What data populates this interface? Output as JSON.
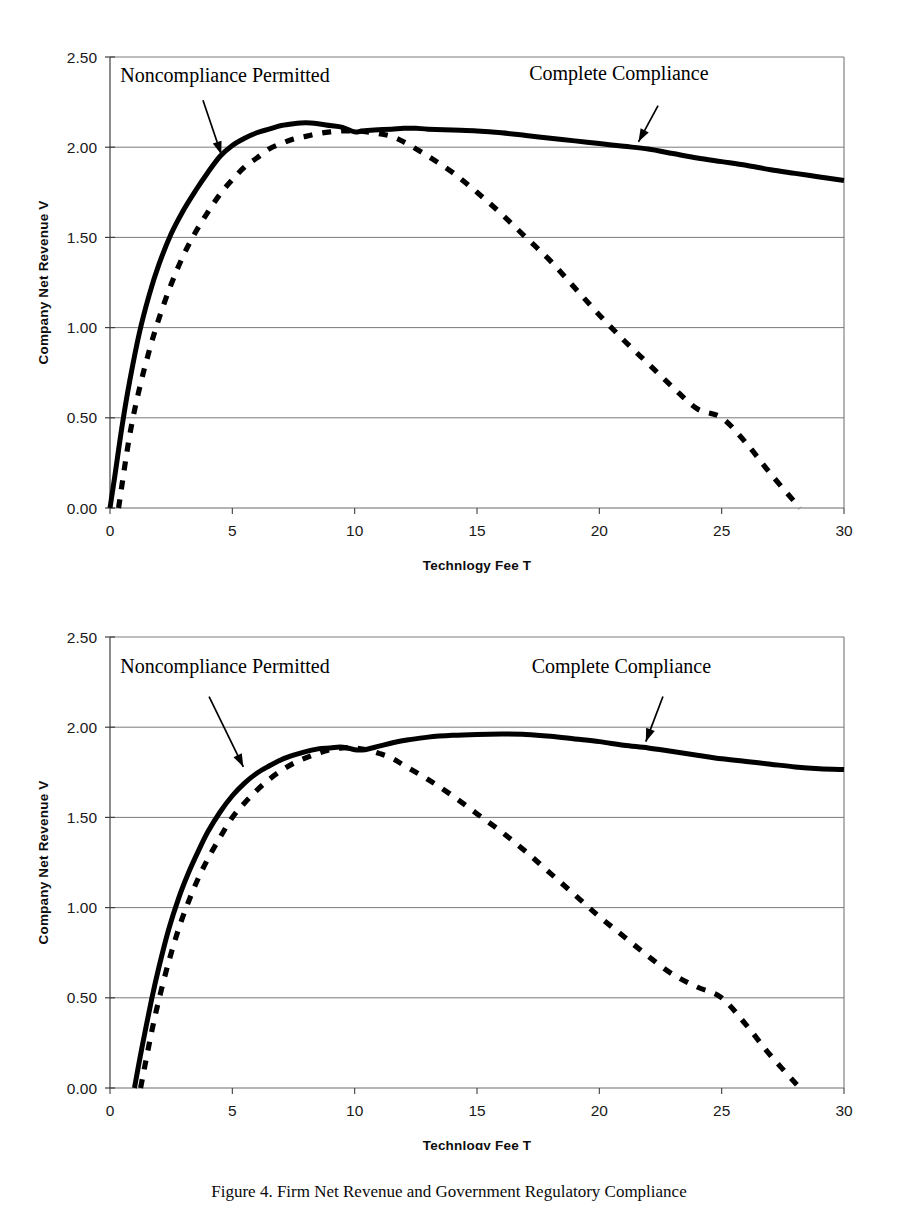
{
  "document": {
    "caption_text": "Figure 4. Firm Net Revenue and Government Regulatory Compliance"
  },
  "chart_data": [
    {
      "id": "figure-1",
      "type": "line",
      "title": "",
      "xlabel": "Technlogy Fee T",
      "ylabel": "Company Net Revenue V",
      "xlim": [
        0,
        30
      ],
      "ylim": [
        0.0,
        2.5
      ],
      "xticks": [
        "0",
        "5",
        "10",
        "15",
        "20",
        "25",
        "30"
      ],
      "xtick_values": [
        0,
        5,
        10,
        15,
        20,
        25,
        30
      ],
      "yticks": [
        "0.00",
        "0.50",
        "1.00",
        "1.50",
        "2.00",
        "2.50"
      ],
      "ytick_values": [
        0.0,
        0.5,
        1.0,
        1.5,
        2.0,
        2.5
      ],
      "grid": "horizontal",
      "legend_position": "annotations",
      "annotations": [
        {
          "name": "noncompliance-permitted",
          "label": "Noncompliance Permitted",
          "label_x": 4.7,
          "label_y": 2.36,
          "arrow_from": [
            3.8,
            2.26
          ],
          "arrow_to": [
            4.55,
            1.96
          ]
        },
        {
          "name": "complete-compliance",
          "label": "Complete Compliance",
          "label_x": 20.8,
          "label_y": 2.37,
          "arrow_from": [
            22.4,
            2.23
          ],
          "arrow_to": [
            21.6,
            2.03
          ]
        }
      ],
      "series": [
        {
          "name": "Complete Compliance",
          "style": "solid",
          "color": "#000000",
          "x": [
            0.0,
            0.2,
            0.5,
            0.8,
            1.2,
            1.6,
            2.0,
            2.5,
            3.0,
            3.5,
            4.0,
            4.5,
            5.0,
            5.5,
            6.0,
            6.5,
            7.0,
            7.5,
            8.0,
            8.5,
            9.0,
            9.5,
            10.0,
            10.3,
            10.8,
            11.5,
            12.0,
            12.5,
            13.0,
            14.0,
            15.0,
            16.0,
            17.0,
            18.0,
            19.0,
            20.0,
            21.0,
            22.0,
            23.0,
            24.0,
            25.0,
            26.0,
            27.0,
            28.0,
            29.0,
            30.0
          ],
          "y": [
            0.0,
            0.18,
            0.46,
            0.7,
            0.97,
            1.18,
            1.35,
            1.52,
            1.65,
            1.76,
            1.86,
            1.95,
            2.01,
            2.05,
            2.08,
            2.1,
            2.12,
            2.13,
            2.135,
            2.13,
            2.12,
            2.11,
            2.085,
            2.09,
            2.095,
            2.1,
            2.105,
            2.105,
            2.1,
            2.095,
            2.09,
            2.08,
            2.065,
            2.05,
            2.035,
            2.02,
            2.005,
            1.99,
            1.965,
            1.94,
            1.92,
            1.9,
            1.875,
            1.855,
            1.835,
            1.815
          ]
        },
        {
          "name": "Noncompliance Permitted",
          "style": "dashed",
          "color": "#000000",
          "x": [
            0.35,
            0.8,
            1.2,
            1.6,
            2.0,
            2.5,
            3.0,
            3.5,
            4.0,
            4.5,
            5.0,
            5.5,
            6.0,
            6.5,
            7.0,
            7.5,
            8.0,
            8.5,
            9.0,
            9.5,
            10.0,
            10.5,
            11.0,
            11.5,
            12.0,
            13.0,
            14.0,
            15.0,
            16.0,
            17.0,
            18.0,
            19.0,
            20.0,
            21.0,
            22.0,
            23.0,
            24.0,
            25.0,
            26.0,
            27.0,
            28.2
          ],
          "y": [
            0.0,
            0.4,
            0.66,
            0.87,
            1.05,
            1.24,
            1.4,
            1.53,
            1.64,
            1.74,
            1.82,
            1.89,
            1.94,
            1.99,
            2.02,
            2.045,
            2.06,
            2.075,
            2.085,
            2.09,
            2.09,
            2.085,
            2.075,
            2.06,
            2.03,
            1.95,
            1.86,
            1.75,
            1.63,
            1.5,
            1.37,
            1.22,
            1.07,
            0.93,
            0.8,
            0.67,
            0.55,
            0.5,
            0.36,
            0.19,
            0.0
          ]
        }
      ]
    },
    {
      "id": "figure-2",
      "type": "line",
      "title": "",
      "xlabel": "Technlogy Fee T",
      "ylabel": "Company Net Revenue V",
      "xlim": [
        0,
        30
      ],
      "ylim": [
        0.0,
        2.5
      ],
      "xticks": [
        "0",
        "5",
        "10",
        "15",
        "20",
        "25",
        "30"
      ],
      "xtick_values": [
        0,
        5,
        10,
        15,
        20,
        25,
        30
      ],
      "yticks": [
        "0.00",
        "0.50",
        "1.00",
        "1.50",
        "2.00",
        "2.50"
      ],
      "ytick_values": [
        0.0,
        0.5,
        1.0,
        1.5,
        2.0,
        2.5
      ],
      "grid": "horizontal",
      "legend_position": "annotations",
      "annotations": [
        {
          "name": "noncompliance-permitted",
          "label": "Noncompliance Permitted",
          "label_x": 4.7,
          "label_y": 2.3,
          "arrow_from": [
            4.05,
            2.17
          ],
          "arrow_to": [
            5.45,
            1.78
          ]
        },
        {
          "name": "complete-compliance",
          "label": "Complete Compliance",
          "label_x": 20.9,
          "label_y": 2.3,
          "arrow_from": [
            22.6,
            2.17
          ],
          "arrow_to": [
            21.9,
            1.92
          ]
        }
      ],
      "series": [
        {
          "name": "Complete Compliance",
          "style": "solid",
          "color": "#000000",
          "x": [
            1.0,
            1.3,
            1.7,
            2.0,
            2.4,
            2.8,
            3.2,
            3.6,
            4.0,
            4.5,
            5.0,
            5.5,
            6.0,
            6.5,
            7.0,
            7.5,
            8.0,
            8.5,
            9.0,
            9.4,
            9.7,
            10.0,
            10.4,
            11.0,
            11.6,
            12.2,
            13.0,
            14.0,
            15.0,
            16.0,
            17.0,
            18.0,
            19.0,
            20.0,
            21.0,
            22.0,
            23.0,
            24.0,
            25.0,
            26.0,
            27.0,
            28.0,
            29.0,
            30.0
          ],
          "y": [
            0.0,
            0.22,
            0.49,
            0.67,
            0.88,
            1.05,
            1.19,
            1.31,
            1.42,
            1.53,
            1.62,
            1.69,
            1.745,
            1.785,
            1.82,
            1.845,
            1.865,
            1.88,
            1.885,
            1.89,
            1.885,
            1.875,
            1.875,
            1.895,
            1.915,
            1.93,
            1.945,
            1.955,
            1.96,
            1.962,
            1.96,
            1.95,
            1.935,
            1.92,
            1.9,
            1.885,
            1.865,
            1.845,
            1.825,
            1.81,
            1.795,
            1.78,
            1.77,
            1.765
          ]
        },
        {
          "name": "Noncompliance Permitted",
          "style": "dashed",
          "color": "#000000",
          "x": [
            1.25,
            1.7,
            2.0,
            2.4,
            2.8,
            3.2,
            3.6,
            4.0,
            4.5,
            5.0,
            5.5,
            6.0,
            6.5,
            7.0,
            7.5,
            8.0,
            8.5,
            9.0,
            9.5,
            10.0,
            10.5,
            11.0,
            11.5,
            12.0,
            13.0,
            14.0,
            15.0,
            16.0,
            17.0,
            18.0,
            19.0,
            20.0,
            21.0,
            22.0,
            23.0,
            24.0,
            25.0,
            26.0,
            27.0,
            28.2
          ],
          "y": [
            0.0,
            0.31,
            0.49,
            0.7,
            0.88,
            1.03,
            1.16,
            1.27,
            1.39,
            1.5,
            1.58,
            1.65,
            1.71,
            1.76,
            1.8,
            1.83,
            1.855,
            1.875,
            1.885,
            1.885,
            1.875,
            1.855,
            1.83,
            1.79,
            1.71,
            1.62,
            1.52,
            1.42,
            1.31,
            1.19,
            1.07,
            0.95,
            0.84,
            0.73,
            0.63,
            0.56,
            0.5,
            0.35,
            0.18,
            0.0
          ]
        }
      ]
    }
  ]
}
